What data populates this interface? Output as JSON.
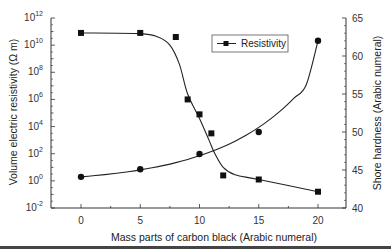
{
  "chart_data": {
    "type": "line",
    "title": "",
    "xlabel": "Mass parts of carbon black (Arabic numeral)",
    "ylabel": "Volume electric resistivity (Ω m)",
    "y2label": "Shore hardness (Arabic numeral)",
    "xlim": [
      -1.5,
      22.5
    ],
    "ylim_log10": [
      -2,
      12
    ],
    "y2lim": [
      40,
      65
    ],
    "yscale": "log",
    "grid": false,
    "legend_position": "upper-right-inside",
    "x_ticks": [
      "0",
      "5",
      "10",
      "15",
      "20"
    ],
    "y_ticks": [
      {
        "base": "10",
        "exp": "12"
      },
      {
        "base": "10",
        "exp": "10"
      },
      {
        "base": "10",
        "exp": "8"
      },
      {
        "base": "10",
        "exp": "6"
      },
      {
        "base": "10",
        "exp": "4"
      },
      {
        "base": "10",
        "exp": "2"
      },
      {
        "base": "10",
        "exp": "0"
      },
      {
        "base": "10",
        "exp": "-2"
      }
    ],
    "y2_ticks": [
      "65",
      "60",
      "55",
      "50",
      "45",
      "40"
    ],
    "series": [
      {
        "name": "Resistivity",
        "axis": "left",
        "marker": "square",
        "show_in_legend": true,
        "x": [
          0,
          5,
          8,
          9,
          10,
          11,
          12,
          15,
          20
        ],
        "log10_values": [
          10.9,
          10.9,
          10.6,
          6.0,
          4.9,
          3.5,
          0.4,
          0.1,
          -0.8
        ],
        "values": [
          80000000000.0,
          80000000000.0,
          40000000000.0,
          1000000.0,
          80000.0,
          3000.0,
          2.5,
          1.3,
          0.16
        ]
      },
      {
        "name": "Shore hardness",
        "axis": "right",
        "marker": "circle",
        "show_in_legend": false,
        "x": [
          0,
          5,
          10,
          15,
          20
        ],
        "values": [
          44.1,
          45.1,
          47.1,
          50.0,
          62.0
        ]
      }
    ]
  },
  "legend": {
    "label": "Resistivity"
  }
}
